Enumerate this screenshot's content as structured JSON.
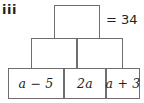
{
  "diagram": {
    "type": "number-pyramid",
    "part_label": "iii",
    "annotation": "= 34",
    "colors": {
      "border": "#6e6e6e",
      "text": "#231f20",
      "background": "#ffffff"
    },
    "rows": [
      {
        "tier": "top",
        "cells": [
          {
            "label": "",
            "filled": false
          }
        ]
      },
      {
        "tier": "middle",
        "cells": [
          {
            "label": "",
            "filled": false
          },
          {
            "label": "",
            "filled": false
          }
        ]
      },
      {
        "tier": "bottom",
        "cells": [
          {
            "label": "a − 5",
            "filled": true
          },
          {
            "label": "2a",
            "filled": true
          },
          {
            "label": "a + 3",
            "filled": true
          }
        ]
      }
    ]
  }
}
